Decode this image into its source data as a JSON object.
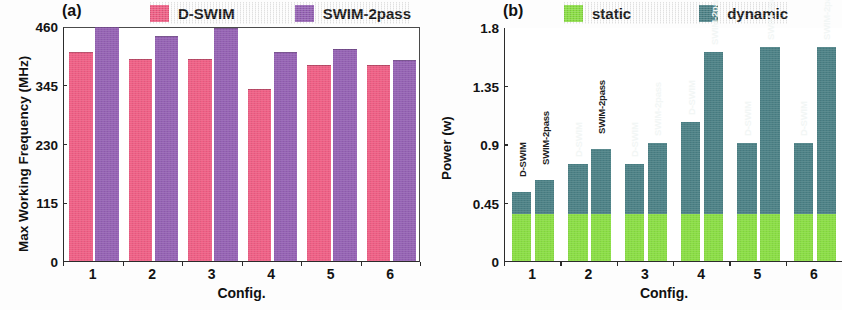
{
  "figure": {
    "background": "#fdfdfd",
    "width": 842,
    "height": 310
  },
  "panel_a": {
    "tag": "(a)",
    "legend": [
      {
        "label": "D-SWIM",
        "color": "#ef5f85"
      },
      {
        "label": "SWIM-2pass",
        "color": "#9562b4"
      }
    ],
    "ylabel": "Max Working Frequency (MHz)",
    "xlabel": "Config.",
    "yticks": [
      "0",
      "115",
      "230",
      "345",
      "460"
    ],
    "xticks": [
      "1",
      "2",
      "3",
      "4",
      "5",
      "6"
    ]
  },
  "panel_b": {
    "tag": "(b)",
    "legend": [
      {
        "label": "static",
        "color": "#8ade44"
      },
      {
        "label": "dynamic",
        "color": "#4c8186"
      }
    ],
    "ylabel": "Power (w)",
    "xlabel": "Config.",
    "yticks": [
      "0",
      "0.45",
      "0.9",
      "1.35",
      "1.8"
    ],
    "xticks": [
      "1",
      "2",
      "3",
      "4",
      "5",
      "6"
    ],
    "bar_labels": [
      "D-SWIM",
      "SWIM-2pass",
      "D-SWIM",
      "SWIM-2pass",
      "D-SWIM",
      "SWIM-2pass",
      "D-SWIM",
      "SWIM-2pass",
      "D-SWIM",
      "SWIM-2pass",
      "D-SWIM",
      "SWIM-2pass"
    ]
  },
  "chart_data": [
    {
      "type": "bar",
      "panel": "(a)",
      "title": "",
      "xlabel": "Config.",
      "ylabel": "Max Working Frequency (MHz)",
      "categories": [
        "1",
        "2",
        "3",
        "4",
        "5",
        "6"
      ],
      "ylim": [
        0,
        460
      ],
      "yticks": [
        0,
        115,
        230,
        345,
        460
      ],
      "grid": false,
      "legend_position": "top",
      "series": [
        {
          "name": "D-SWIM",
          "color": "#ef5f85",
          "values": [
            409,
            395,
            395,
            336,
            383,
            383
          ]
        },
        {
          "name": "SWIM-2pass",
          "color": "#9562b4",
          "values": [
            458,
            440,
            456,
            409,
            415,
            393
          ]
        }
      ]
    },
    {
      "type": "bar",
      "panel": "(b)",
      "stacked": true,
      "title": "",
      "xlabel": "Config.",
      "ylabel": "Power (w)",
      "categories": [
        "1",
        "2",
        "3",
        "4",
        "5",
        "6"
      ],
      "bar_variants": [
        "D-SWIM",
        "SWIM-2pass"
      ],
      "ylim": [
        0,
        1.8
      ],
      "yticks": [
        0,
        0.45,
        0.9,
        1.35,
        1.8
      ],
      "grid": false,
      "legend_position": "top",
      "bar_names": [
        "D-SWIM",
        "SWIM-2pass",
        "D-SWIM",
        "SWIM-2pass",
        "D-SWIM",
        "SWIM-2pass",
        "D-SWIM",
        "SWIM-2pass",
        "D-SWIM",
        "SWIM-2pass",
        "D-SWIM",
        "SWIM-2pass"
      ],
      "series": [
        {
          "name": "static",
          "color": "#8ade44",
          "values": [
            0.36,
            0.36,
            0.36,
            0.36,
            0.36,
            0.36,
            0.36,
            0.36,
            0.36,
            0.36,
            0.36,
            0.36
          ]
        },
        {
          "name": "dynamic",
          "color": "#4c8186",
          "values": [
            0.17,
            0.26,
            0.39,
            0.5,
            0.39,
            0.55,
            0.71,
            1.25,
            0.55,
            1.29,
            0.55,
            1.29
          ]
        }
      ],
      "totals": [
        0.53,
        0.62,
        0.75,
        0.86,
        0.75,
        0.91,
        1.07,
        1.61,
        0.91,
        1.65,
        0.91,
        1.65
      ]
    }
  ]
}
